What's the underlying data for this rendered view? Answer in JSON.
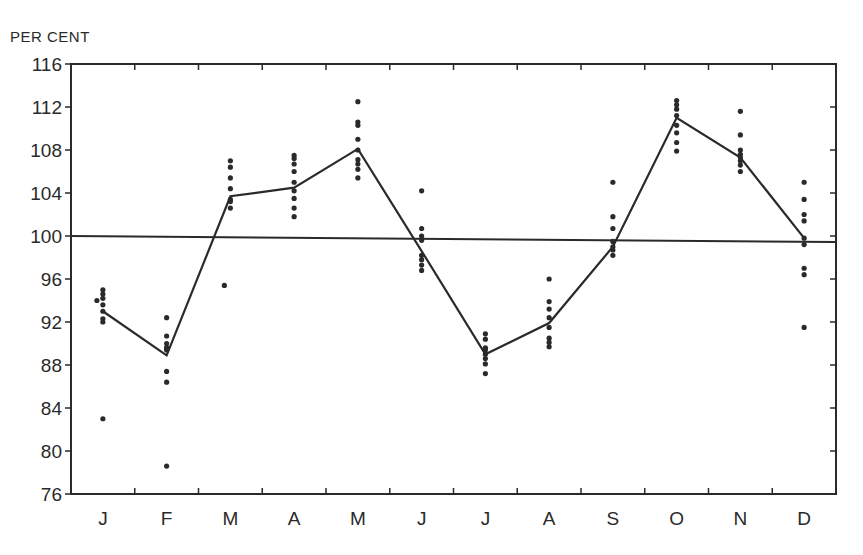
{
  "chart_data": {
    "type": "line",
    "title": "",
    "ylabel": "PER CENT",
    "xlabel": "",
    "ylim": [
      76,
      116
    ],
    "yticks": [
      76,
      80,
      84,
      88,
      92,
      96,
      100,
      104,
      108,
      112,
      116
    ],
    "categories": [
      "J",
      "F",
      "M",
      "A",
      "M",
      "J",
      "J",
      "A",
      "S",
      "O",
      "N",
      "D"
    ],
    "grid": false,
    "reference_line": 100,
    "series": [
      {
        "name": "Seasonal index (mean)",
        "type": "line",
        "values": [
          93.0,
          88.9,
          103.7,
          104.5,
          108.1,
          98.6,
          89.0,
          91.9,
          99.0,
          111.0,
          107.3,
          99.8
        ]
      },
      {
        "name": "Individual year indices",
        "type": "scatter",
        "points": [
          [
            93.0,
            93.6,
            94.2,
            94.6,
            95.0,
            92.3,
            92.0,
            83.0,
            94.0
          ],
          [
            89.6,
            89.4,
            90.0,
            90.7,
            92.4,
            87.4,
            86.4,
            78.6,
            89.6
          ],
          [
            103.2,
            103.4,
            102.6,
            104.4,
            105.4,
            106.4,
            107.0,
            95.4
          ],
          [
            103.5,
            104.2,
            102.6,
            101.8,
            105.0,
            106.0,
            106.7,
            107.2,
            107.5
          ],
          [
            108.0,
            109.0,
            107.1,
            106.7,
            106.2,
            105.4,
            110.3,
            110.6,
            112.5
          ],
          [
            99.6,
            100.0,
            100.7,
            98.2,
            97.8,
            97.3,
            96.8,
            104.2
          ],
          [
            89.6,
            89.0,
            88.6,
            90.4,
            90.9,
            88.1,
            87.2,
            89.4
          ],
          [
            91.5,
            92.4,
            93.2,
            93.9,
            90.5,
            90.1,
            89.7,
            96.0
          ],
          [
            99.0,
            99.5,
            98.7,
            98.2,
            100.7,
            101.8,
            105.0
          ],
          [
            111.2,
            111.8,
            112.2,
            112.6,
            110.3,
            109.6,
            108.7,
            107.9
          ],
          [
            107.3,
            107.6,
            107.0,
            106.6,
            108.0,
            109.4,
            111.6,
            106.0
          ],
          [
            99.8,
            99.2,
            101.4,
            102.0,
            103.4,
            105.0,
            97.0,
            96.4,
            91.5
          ]
        ]
      }
    ]
  },
  "legend": {
    "y_axis_title": "PER CENT"
  },
  "colors": {
    "ink": "#2a2a2a",
    "background": "#ffffff"
  }
}
